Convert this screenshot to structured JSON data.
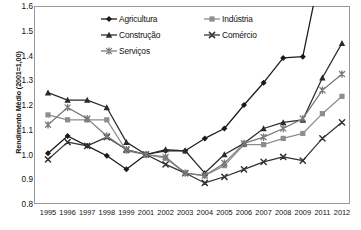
{
  "chart_data": {
    "type": "line",
    "title": "",
    "xlabel": "",
    "ylabel": "Rendimento Médio (2001=1,00)",
    "ylim": [
      0.8,
      1.6
    ],
    "ytick_step": 0.1,
    "yticks": [
      "1.6",
      "1.5",
      "1.4",
      "1.3",
      "1.2",
      "1.1",
      "1.0",
      "0.9",
      "0.8"
    ],
    "grid": false,
    "legend_position": "top-center-inside",
    "categories": [
      "1995",
      "1996",
      "1997",
      "1998",
      "1999",
      "2001",
      "2002",
      "2003",
      "2004",
      "2005",
      "2006",
      "2007",
      "2008",
      "2009",
      "2011",
      "2012"
    ],
    "note_clipped": "Agricultura exceeds the 1.6 axis maximum at 2011 and 2012 and is drawn clipped at the top of the plot area",
    "series": [
      {
        "name": "Agricultura",
        "marker": "diamond",
        "color": "#1a1a1a",
        "values": [
          1.005,
          1.075,
          1.035,
          0.995,
          0.94,
          1.0,
          1.015,
          1.015,
          1.065,
          1.105,
          1.2,
          1.29,
          1.39,
          1.395,
          1.78,
          2.05
        ]
      },
      {
        "name": "Indústria",
        "marker": "square",
        "color": "#8d8d8d",
        "values": [
          1.16,
          1.14,
          1.14,
          1.14,
          1.015,
          1.0,
          0.985,
          0.925,
          0.915,
          0.955,
          1.04,
          1.04,
          1.065,
          1.085,
          1.165,
          1.235
        ]
      },
      {
        "name": "Construção",
        "marker": "triangle",
        "color": "#2b2b2b",
        "values": [
          1.25,
          1.22,
          1.22,
          1.19,
          1.05,
          1.0,
          1.02,
          1.015,
          0.925,
          1.0,
          1.045,
          1.105,
          1.13,
          1.14,
          1.31,
          1.45
        ]
      },
      {
        "name": "Comércio",
        "marker": "x",
        "color": "#333333",
        "values": [
          0.98,
          1.05,
          1.035,
          1.07,
          1.02,
          1.0,
          0.96,
          0.925,
          0.885,
          0.91,
          0.94,
          0.97,
          0.99,
          0.975,
          1.065,
          1.13
        ]
      },
      {
        "name": "Serviços",
        "marker": "star",
        "color": "#7a7a7a",
        "values": [
          1.12,
          1.19,
          1.145,
          1.075,
          1.02,
          1.0,
          0.99,
          0.925,
          0.915,
          0.965,
          1.045,
          1.07,
          1.105,
          1.145,
          1.26,
          1.325
        ]
      }
    ]
  },
  "legend": {
    "entries": [
      {
        "label": "Agricultura"
      },
      {
        "label": "Indústria"
      },
      {
        "label": "Construção"
      },
      {
        "label": "Comércio"
      },
      {
        "label": "Serviços"
      }
    ]
  }
}
